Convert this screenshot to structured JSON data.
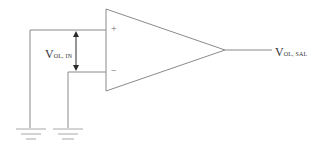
{
  "diagram": {
    "type": "op-amp comparator schematic",
    "input_label": {
      "main": "V",
      "sub": "OL, IN"
    },
    "output_label": {
      "main": "V",
      "sub": "OL, SAL"
    },
    "non_inverting_sign": "+",
    "inverting_sign": "−",
    "ground_count": 2,
    "colors": {
      "wire": "#8a8a8a",
      "arrow": "#2a2a2a",
      "text": "#333333",
      "background": "#ffffff"
    }
  }
}
